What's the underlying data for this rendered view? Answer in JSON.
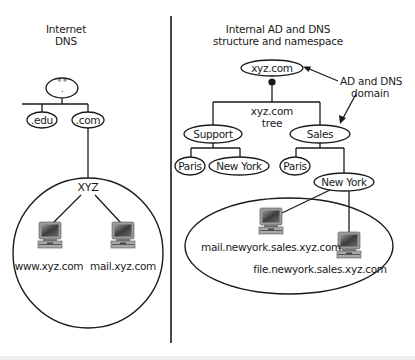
{
  "left_panel": {
    "title_line1": "Internet",
    "title_line2": "DNS",
    "root_node": "\" \"\n.",
    "root_quote": "\" \"",
    "root_dot": ".",
    "nodes": [
      ".edu",
      ".com"
    ],
    "domain_circle_label": "XYZ",
    "hosts": [
      {
        "name": "www.xyz.com",
        "icon": "computer-icon"
      },
      {
        "name": "mail.xyz.com",
        "icon": "computer-icon"
      }
    ]
  },
  "right_panel": {
    "title_line1": "Internal AD and DNS",
    "title_line2": "structure and namespace",
    "root_node": "xyz.com",
    "tree_label_line1": "xyz.com",
    "tree_label_line2": "tree",
    "annotation_line1": "AD and DNS",
    "annotation_line2": "domain",
    "level1": [
      "Support",
      "Sales"
    ],
    "support_children": [
      "Paris",
      "New York"
    ],
    "sales_children": [
      "Paris",
      "New York"
    ],
    "hosts": [
      {
        "name": "mail.newyork.sales.xyz.com",
        "icon": "computer-icon"
      },
      {
        "name": "file.newyork.sales.xyz.com",
        "icon": "computer-icon"
      }
    ]
  },
  "colors": {
    "stroke": "#1a1a1a",
    "background": "#ffffff",
    "monitor_body": "#8a8a8a",
    "monitor_screen": "#4a4a4a"
  }
}
